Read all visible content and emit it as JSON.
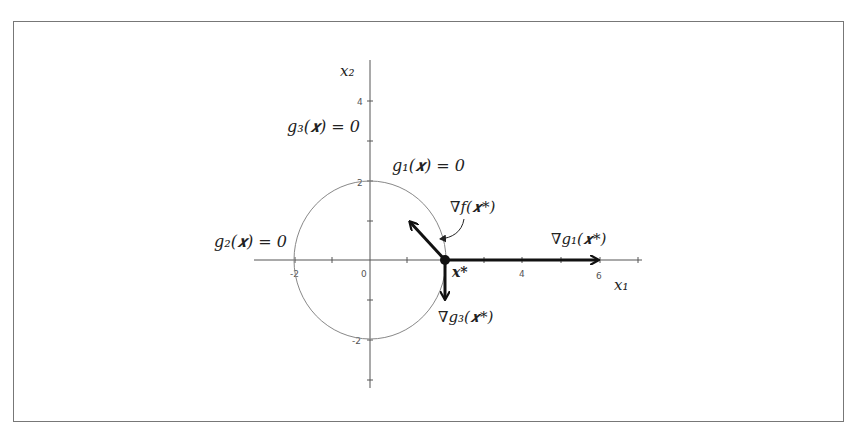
{
  "diagram": {
    "type": "KKT constraint geometry",
    "axes": {
      "x_label": "x₁",
      "y_label": "x₂",
      "x_ticks": [
        "-2",
        "0",
        "4",
        "6"
      ],
      "y_ticks": [
        "4",
        "2",
        "-2"
      ],
      "x_range": [
        -3,
        7
      ],
      "y_range": [
        -3.2,
        5
      ]
    },
    "constraints": {
      "g1": "g₁(𝒙) = 0",
      "g2": "g₂(𝒙) = 0",
      "g3": "g₃(𝒙) = 0"
    },
    "point": {
      "label": "𝒙*",
      "x": 2,
      "y": 0
    },
    "vectors": {
      "grad_f": "∇f(𝒙*)",
      "grad_g1": "∇g₁(𝒙*)",
      "grad_g3": "∇g₃(𝒙*)"
    },
    "circle": {
      "center": [
        0,
        0
      ],
      "radius": 2
    },
    "colors": {
      "axis": "#555555",
      "circle": "#888888",
      "vector": "#111111",
      "frame": "#777777"
    }
  }
}
